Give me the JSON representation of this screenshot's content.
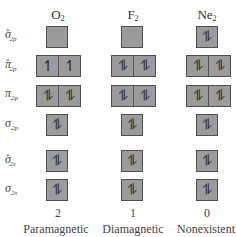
{
  "columns": [
    {
      "molecule": "O",
      "subscript": "2",
      "bond_count": "2",
      "magnetism": "Paramagnetic"
    },
    {
      "molecule": "F",
      "subscript": "2",
      "bond_count": "1",
      "magnetism": "Diamagnetic"
    },
    {
      "molecule": "Ne",
      "subscript": "2",
      "bond_count": "0",
      "magnetism": "Nonexistent"
    }
  ],
  "rows": [
    {
      "symbol": "σ",
      "star": "*",
      "subscript": "2p",
      "orbitals": 1
    },
    {
      "symbol": "π",
      "star": "*",
      "subscript": "2p",
      "orbitals": 2
    },
    {
      "symbol": "π",
      "star": "",
      "subscript": "2p",
      "orbitals": 2
    },
    {
      "symbol": "σ",
      "star": "",
      "subscript": "2p",
      "orbitals": 1
    },
    {
      "symbol": "σ",
      "star": "*",
      "subscript": "2s",
      "orbitals": 1
    },
    {
      "symbol": "σ",
      "star": "",
      "subscript": "2s",
      "orbitals": 1
    }
  ],
  "occupancy": {
    "O2": {
      "sigma_star_2p": [
        ""
      ],
      "pi_star_2p": [
        "↿",
        "↿"
      ],
      "pi_2p": [
        "⥮",
        "⥮"
      ],
      "sigma_2p": [
        "⥮"
      ],
      "sigma_star_2s": [
        "⥮"
      ],
      "sigma_2s": [
        "⥮"
      ]
    },
    "F2": {
      "sigma_star_2p": [
        ""
      ],
      "pi_star_2p": [
        "⥮",
        "⥮"
      ],
      "pi_2p": [
        "⥮",
        "⥮"
      ],
      "sigma_2p": [
        "⥮"
      ],
      "sigma_star_2s": [
        "⥮"
      ],
      "sigma_2s": [
        "⥮"
      ]
    },
    "Ne2": {
      "sigma_star_2p": [
        "⥮"
      ],
      "pi_star_2p": [
        "⥮",
        "⥮"
      ],
      "pi_2p": [
        "⥮",
        "⥮"
      ],
      "sigma_2p": [
        "⥮"
      ],
      "sigma_star_2s": [
        "⥮"
      ],
      "sigma_2s": [
        "⥮"
      ]
    }
  },
  "colors": {
    "box_fill": "#9b9b9b",
    "box_border": "#505050",
    "text": "#444444"
  }
}
